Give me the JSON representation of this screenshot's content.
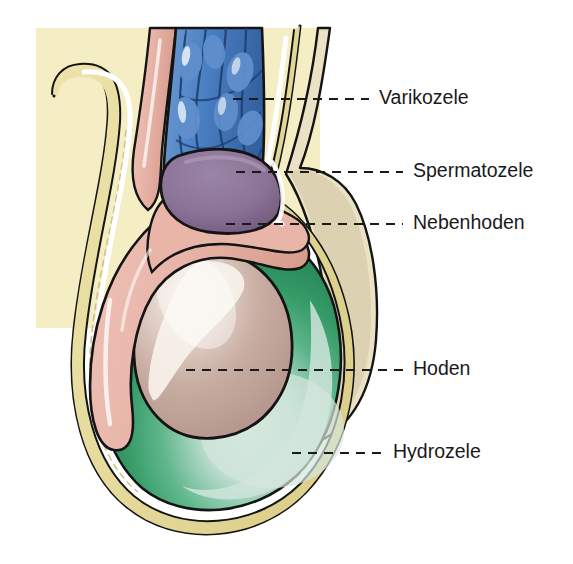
{
  "figure": {
    "language": "de",
    "width": 573,
    "height": 564,
    "background_color": "#ffffff"
  },
  "colors": {
    "page_background": "#ffffff",
    "skin_background": "#f5edc3",
    "scrotum_wall_beige": "#ebe2c5",
    "scrotum_wall_yellow": "#e8dda0",
    "vein_blue": "#4a7fc1",
    "vein_blue_dark": "#2f5c9e",
    "spermatocele_purple": "#8a7396",
    "spermatocele_purple_dark": "#6d5578",
    "epididymis_pink": "#e8b4a8",
    "epididymis_pink_dark": "#d79a8c",
    "testis_tan": "#c4a89e",
    "testis_highlight": "#f2ece4",
    "hydrocele_green": "#3a9f6b",
    "hydrocele_green_light": "#c8e0d4",
    "outline_black": "#141414",
    "label_text": "#1a1a1a",
    "leader_line": "#1a1a1a"
  },
  "labels": [
    {
      "id": "varikozele",
      "text": "Varikozele",
      "text_x": 379,
      "text_y": 99,
      "leader_from_x": 233,
      "leader_to_x": 369,
      "leader_y": 99,
      "structure": "varicocele",
      "structure_color": "#4a7fc1"
    },
    {
      "id": "spermatozele",
      "text": "Spermatozele",
      "text_x": 413,
      "text_y": 172,
      "leader_from_x": 236,
      "leader_to_x": 403,
      "leader_y": 172,
      "structure": "spermatocele",
      "structure_color": "#8a7396"
    },
    {
      "id": "nebenhoden",
      "text": "Nebenhoden",
      "text_x": 413,
      "text_y": 224,
      "leader_from_x": 226,
      "leader_to_x": 403,
      "leader_y": 224,
      "structure": "epididymis",
      "structure_color": "#e8b4a8"
    },
    {
      "id": "hoden",
      "text": "Hoden",
      "text_x": 413,
      "text_y": 370,
      "leader_from_x": 186,
      "leader_to_x": 403,
      "leader_y": 370,
      "structure": "testis",
      "structure_color": "#c4a89e"
    },
    {
      "id": "hydrozele",
      "text": "Hydrozele",
      "text_x": 393,
      "text_y": 453,
      "leader_from_x": 292,
      "leader_to_x": 383,
      "leader_y": 453,
      "structure": "hydrocele",
      "structure_color": "#3a9f6b"
    }
  ],
  "structures": [
    {
      "id": "skin-backdrop",
      "name": "Skin / body wall backdrop",
      "color": "#f5edc3"
    },
    {
      "id": "scrotal-wall",
      "name": "Scrotal wall layers",
      "color": "#e8dda0"
    },
    {
      "id": "varicocele-veins",
      "name": "Varicocele — dilated pampiniform plexus veins",
      "color": "#4a7fc1"
    },
    {
      "id": "spermatocele-cyst",
      "name": "Spermatocele — epididymal cyst",
      "color": "#8a7396"
    },
    {
      "id": "epididymis",
      "name": "Nebenhoden — epididymis",
      "color": "#e8b4a8"
    },
    {
      "id": "testis",
      "name": "Hoden — testis",
      "color": "#c4a89e"
    },
    {
      "id": "hydrocele-fluid",
      "name": "Hydrozele — tunica vaginalis fluid collection",
      "color": "#3a9f6b"
    },
    {
      "id": "contralateral-scrotum",
      "name": "Contralateral scrotal contour",
      "color": "#ebe2c5"
    }
  ]
}
